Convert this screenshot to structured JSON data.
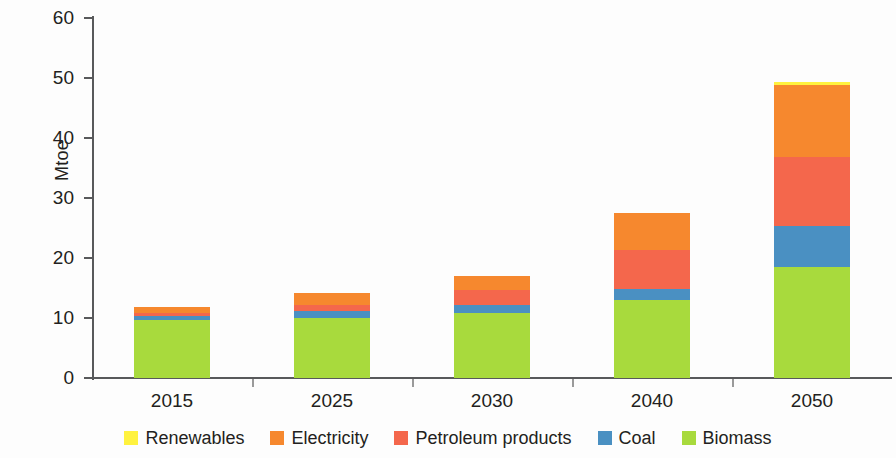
{
  "chart_data": {
    "type": "bar",
    "stacked": true,
    "title": "",
    "subtitle": "",
    "xlabel": "",
    "ylabel": "Mtoe",
    "categories": [
      "2015",
      "2025",
      "2030",
      "2040",
      "2050"
    ],
    "ylim": [
      0,
      60
    ],
    "yticks": [
      0,
      10,
      20,
      30,
      40,
      50,
      60
    ],
    "ytick_labels": [
      "0",
      "10",
      "20",
      "30",
      "40",
      "50",
      "60"
    ],
    "grid": false,
    "legend_position": "bottom",
    "series": [
      {
        "name": "Renewables",
        "color": "#fff23f",
        "values": [
          0.0,
          0.0,
          0.0,
          0.0,
          0.6
        ]
      },
      {
        "name": "Electricity",
        "color": "#f6882e",
        "values": [
          1.0,
          2.1,
          2.3,
          6.2,
          12.0
        ]
      },
      {
        "name": "Petroleum products",
        "color": "#f4674c",
        "values": [
          0.6,
          1.0,
          2.5,
          6.5,
          11.5
        ]
      },
      {
        "name": "Coal",
        "color": "#4a90c2",
        "values": [
          0.6,
          1.1,
          1.4,
          1.8,
          6.8
        ]
      },
      {
        "name": "Biomass",
        "color": "#a8da3d",
        "values": [
          9.7,
          10.0,
          10.8,
          13.0,
          18.5
        ]
      }
    ],
    "totals": [
      11.9,
      14.2,
      17.0,
      27.5,
      49.4
    ],
    "axis_color": "#58595b",
    "text_color": "#231f20",
    "background": "#fdfdfd"
  },
  "legend": {
    "items": [
      {
        "label": "Renewables",
        "color": "#fff23f"
      },
      {
        "label": "Electricity",
        "color": "#f6882e"
      },
      {
        "label": "Petroleum products",
        "color": "#f4674c"
      },
      {
        "label": "Coal",
        "color": "#4a90c2"
      },
      {
        "label": "Biomass",
        "color": "#a8da3d"
      }
    ]
  }
}
